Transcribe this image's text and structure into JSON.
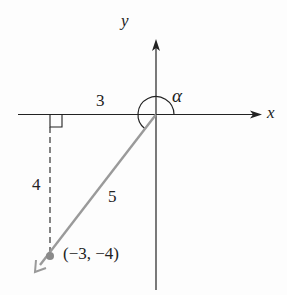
{
  "diagram": {
    "axis_labels": {
      "x": "x",
      "y": "y"
    },
    "angle_label": "α",
    "side_labels": {
      "horizontal": "3",
      "vertical": "4",
      "hypotenuse": "5"
    },
    "point_label": "(−3, −4)",
    "colors": {
      "axes": "#222222",
      "ray": "#9a9a9a",
      "point": "#8a8a8a",
      "dashed": "#333333"
    }
  }
}
